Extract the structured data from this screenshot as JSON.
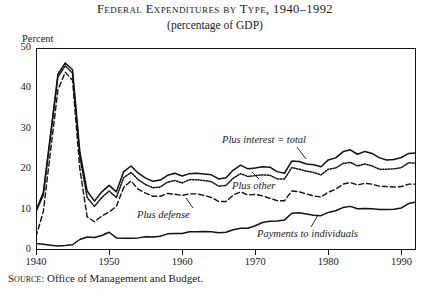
{
  "title": {
    "main": "Federal Expenditures by Type, 1940–1992",
    "sub": "(percentage of GDP)"
  },
  "axes": {
    "ylabel": "Percent",
    "yticks": [
      "0",
      "10",
      "20",
      "30",
      "40",
      "50"
    ],
    "xticks": [
      "1940",
      "1950",
      "1960",
      "1970",
      "1980",
      "1990"
    ]
  },
  "annotations": {
    "total": "Plus interest  =  total",
    "other": "Plus other",
    "defense": "Plus defense",
    "payments": "Payments to individuals"
  },
  "source": {
    "label": "Source:",
    "text": "Office of Management and Budget."
  },
  "chart_data": {
    "type": "line",
    "title": "Federal Expenditures by Type, 1940–1992",
    "subtitle": "(percentage of GDP)",
    "xlabel": "",
    "ylabel": "Percent",
    "xlim": [
      1940,
      1992
    ],
    "ylim": [
      0,
      50
    ],
    "grid": false,
    "legend": "inline-annotations",
    "xticks": [
      1940,
      1950,
      1960,
      1970,
      1980,
      1990
    ],
    "yticks": [
      0,
      10,
      20,
      30,
      40,
      50
    ],
    "x": [
      1940,
      1941,
      1942,
      1943,
      1944,
      1945,
      1946,
      1947,
      1948,
      1949,
      1950,
      1951,
      1952,
      1953,
      1954,
      1955,
      1956,
      1957,
      1958,
      1959,
      1960,
      1961,
      1962,
      1963,
      1964,
      1965,
      1966,
      1967,
      1968,
      1969,
      1970,
      1971,
      1972,
      1973,
      1974,
      1975,
      1976,
      1977,
      1978,
      1979,
      1980,
      1981,
      1982,
      1983,
      1984,
      1985,
      1986,
      1987,
      1988,
      1989,
      1990,
      1991,
      1992
    ],
    "series": [
      {
        "name": "Payments to individuals",
        "style": "solid",
        "annotation": "Payments to individuals",
        "values": [
          1.6,
          1.4,
          1.2,
          1.0,
          1.1,
          1.3,
          2.6,
          3.2,
          3.1,
          3.6,
          4.4,
          3.0,
          2.9,
          2.9,
          3.0,
          3.3,
          3.2,
          3.4,
          4.0,
          4.1,
          4.1,
          4.5,
          4.5,
          4.6,
          4.5,
          4.3,
          4.4,
          5.0,
          5.4,
          5.4,
          6.0,
          6.8,
          7.1,
          7.2,
          7.4,
          9.1,
          9.2,
          8.9,
          8.6,
          8.5,
          9.3,
          9.7,
          10.5,
          10.8,
          10.2,
          10.3,
          10.2,
          10.0,
          10.0,
          10.1,
          10.4,
          11.5,
          11.9
        ]
      },
      {
        "name": "Plus defense",
        "style": "dashed",
        "annotation": "Plus defense",
        "values": [
          3.3,
          9.5,
          24.6,
          39.6,
          44.0,
          42.0,
          20.0,
          8.2,
          7.0,
          8.4,
          9.4,
          10.8,
          15.5,
          17.1,
          15.0,
          14.1,
          13.3,
          13.3,
          14.0,
          13.8,
          13.5,
          13.9,
          13.9,
          13.5,
          13.0,
          12.0,
          12.0,
          13.6,
          14.4,
          13.6,
          13.8,
          13.4,
          12.8,
          12.2,
          12.2,
          14.6,
          14.4,
          13.9,
          13.4,
          13.1,
          14.3,
          15.0,
          16.3,
          16.7,
          16.1,
          16.5,
          16.3,
          15.8,
          15.7,
          15.6,
          15.7,
          16.3,
          16.3
        ]
      },
      {
        "name": "Plus other",
        "style": "dotted",
        "annotation": "Plus other",
        "values": [
          9.4,
          13.6,
          28.2,
          42.8,
          45.6,
          43.8,
          23.1,
          13.0,
          10.8,
          13.0,
          14.6,
          13.0,
          17.9,
          19.2,
          17.4,
          16.2,
          15.4,
          15.6,
          16.8,
          17.2,
          16.6,
          17.4,
          17.4,
          17.2,
          16.9,
          15.8,
          16.0,
          17.8,
          18.9,
          18.2,
          18.4,
          18.6,
          18.5,
          17.6,
          17.6,
          20.4,
          20.0,
          19.5,
          19.2,
          18.6,
          20.0,
          20.3,
          21.4,
          21.7,
          20.8,
          21.3,
          20.8,
          20.0,
          20.0,
          20.1,
          20.4,
          21.6,
          21.5
        ]
      },
      {
        "name": "Plus interest = total",
        "style": "solid",
        "annotation": "Plus interest  =  total",
        "values": [
          9.8,
          14.2,
          28.8,
          43.5,
          46.3,
          44.6,
          24.3,
          14.6,
          12.1,
          14.4,
          16.0,
          14.4,
          19.4,
          20.8,
          19.0,
          17.8,
          17.0,
          17.3,
          18.5,
          19.0,
          18.3,
          18.9,
          19.0,
          18.8,
          18.6,
          17.6,
          17.9,
          19.8,
          21.0,
          20.1,
          20.3,
          20.6,
          20.5,
          19.4,
          19.0,
          22.0,
          21.9,
          21.3,
          21.1,
          20.6,
          22.3,
          22.8,
          24.3,
          24.8,
          23.7,
          24.4,
          23.9,
          22.8,
          22.3,
          22.4,
          22.9,
          23.9,
          24.0
        ]
      }
    ]
  }
}
